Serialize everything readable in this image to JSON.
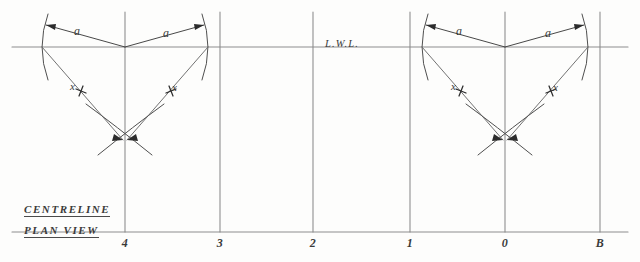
{
  "drawing": {
    "title": "Plan View Lofting Construction",
    "waterline_label": "L.W.L.",
    "captions": {
      "centreline": "CENTRELINE",
      "plan_view": "PLAN VIEW"
    },
    "stations": [
      {
        "label": "4",
        "x": 125
      },
      {
        "label": "3",
        "x": 220
      },
      {
        "label": "2",
        "x": 313
      },
      {
        "label": "1",
        "x": 410
      },
      {
        "label": "0",
        "x": 505
      },
      {
        "label": "B",
        "x": 600
      }
    ],
    "dimension_labels": [
      {
        "text": "a",
        "x": 74,
        "y": 30
      },
      {
        "text": "a",
        "x": 163,
        "y": 32
      },
      {
        "text": "a",
        "x": 456,
        "y": 30
      },
      {
        "text": "a",
        "x": 545,
        "y": 32
      }
    ],
    "radius_labels": [
      {
        "text": "x",
        "x": 76,
        "y": 86
      },
      {
        "text": "x",
        "x": 168,
        "y": 87
      },
      {
        "text": "x",
        "x": 457,
        "y": 86
      },
      {
        "text": "x",
        "x": 549,
        "y": 87
      }
    ],
    "constructions": [
      {
        "name": "station-4-construction",
        "centre_x": 125,
        "half_breadth": 83,
        "apex_y": 134
      },
      {
        "name": "station-0-construction",
        "centre_x": 505,
        "half_breadth": 83,
        "apex_y": 134
      }
    ],
    "geometry": {
      "waterline_y": 47,
      "baseline_y": 232,
      "waterline_x_start": 12,
      "waterline_x_end": 628,
      "baseline_x_start": 12,
      "baseline_x_end": 628,
      "station_top_y": 12,
      "station_bottom_y": 232
    },
    "colors": {
      "ink": "#4a4a4a",
      "rule": "#8d8d8d",
      "paper": "#fdfdfc",
      "accent": "#2c2c2c"
    }
  }
}
